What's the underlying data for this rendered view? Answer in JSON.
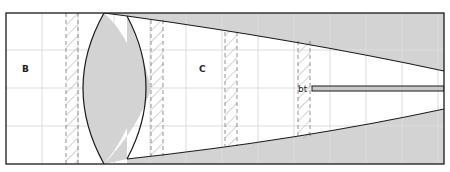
{
  "diagram": {
    "type": "optical-cross-section",
    "frame": {
      "x": 6,
      "y": 13,
      "width": 438,
      "height": 151
    },
    "colors": {
      "background": "#ffffff",
      "fill_gray": "#d3d3d3",
      "outline": "#1a1a1a",
      "grid": "#dcdcdc",
      "hatch": "#9a9a9a"
    },
    "grid": {
      "vertical_x": [
        42,
        78,
        114,
        150,
        186,
        222,
        258,
        294,
        330,
        366,
        402,
        438
      ],
      "horizontal_y": [
        50,
        88,
        126
      ]
    },
    "labels": {
      "region_b": "B",
      "region_c": "C",
      "rod_label": "bt"
    },
    "hatched_strips": [
      {
        "x": 66,
        "width": 12
      },
      {
        "x": 151,
        "width": 12
      },
      {
        "x": 225,
        "width": 12
      },
      {
        "x": 298,
        "width": 12
      }
    ],
    "lens": {
      "top_x": 104,
      "top_y": 13,
      "bottom_y": 164,
      "left_x": 79,
      "right_x": 151
    },
    "cone": {
      "start_x": 127,
      "top_start_y": 16,
      "bottom_start_y": 159,
      "end_x": 444,
      "top_end_y": 71,
      "bottom_end_y": 109
    },
    "rod": {
      "x": 312,
      "y": 86,
      "width": 132,
      "height": 5
    }
  }
}
